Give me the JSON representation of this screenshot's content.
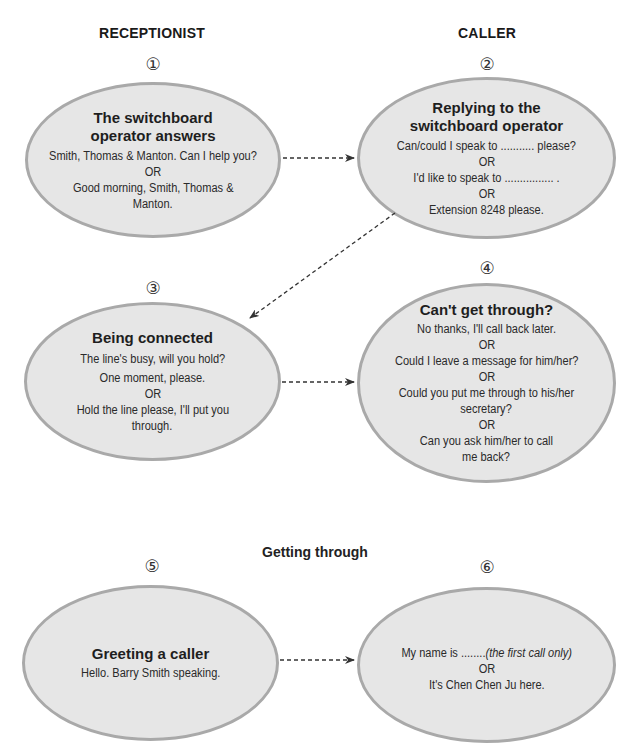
{
  "headers": {
    "left": "RECEPTIONIST",
    "right": "CALLER"
  },
  "section_label": "Getting through",
  "nodes": [
    {
      "number": "①",
      "title_lines": [
        "The switchboard",
        "operator answers"
      ],
      "lines": [
        "Smith, Thomas & Manton. Can I help you?",
        "OR",
        "Good morning, Smith, Thomas &",
        "Manton."
      ]
    },
    {
      "number": "②",
      "title_lines": [
        "Replying to the",
        "switchboard operator"
      ],
      "lines": [
        "Can/could I speak to ........... please?",
        "OR",
        "I'd like to speak to ................ .",
        "OR",
        "Extension 8248 please."
      ]
    },
    {
      "number": "③",
      "title_lines": [
        "Being connected"
      ],
      "lines": [
        "The line's busy, will you hold?",
        "One moment, please.",
        "OR",
        "Hold the line please, I'll put you",
        "through."
      ]
    },
    {
      "number": "④",
      "title_lines": [
        "Can't get through?"
      ],
      "lines": [
        "No thanks, I'll call back later.",
        "OR",
        "Could I leave a message for him/her?",
        "OR",
        "Could you put me through to his/her",
        "secretary?",
        "OR",
        "Can you ask him/her to call",
        "me back?"
      ]
    },
    {
      "number": "⑤",
      "title_lines": [
        "Greeting a caller"
      ],
      "lines": [
        "Hello. Barry Smith speaking."
      ]
    },
    {
      "number": "⑥",
      "title_lines": [],
      "lines_prefix": "My name is ........",
      "lines_italic": "(the first call only)",
      "lines": [
        "OR",
        "It's Chen Chen Ju here."
      ]
    }
  ],
  "arrows": [
    {
      "from": "1",
      "to": "2",
      "style": "dashed"
    },
    {
      "from": "2",
      "to": "3",
      "style": "dashed"
    },
    {
      "from": "3",
      "to": "4",
      "style": "dashed"
    },
    {
      "from": "5",
      "to": "6",
      "style": "dashed"
    }
  ],
  "colors": {
    "ellipse_fill": "#e6e6e6",
    "ellipse_border": "#a9a9a9",
    "arrow": "#333333"
  }
}
